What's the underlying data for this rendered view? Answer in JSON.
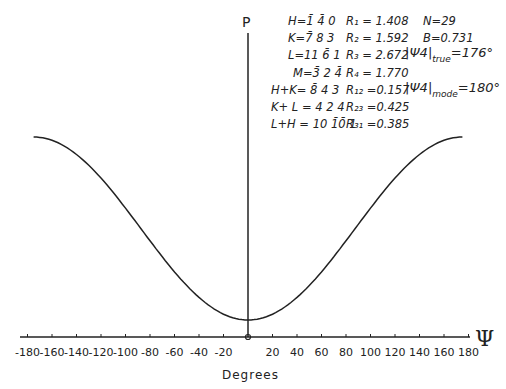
{
  "chart_data": {
    "type": "line",
    "title": "",
    "xlabel": "Degrees",
    "ylabel": "P",
    "x_axis_symbol": "Ψ",
    "xlim": [
      -180,
      180
    ],
    "x_ticks": [
      -180,
      -160,
      -140,
      -120,
      -100,
      -80,
      -60,
      -40,
      -20,
      20,
      40,
      60,
      80,
      100,
      120,
      140,
      160,
      180
    ],
    "x_tick_labels": [
      "-180",
      "-160",
      "-140",
      "-120",
      "-100",
      "-80",
      "-60",
      "-40",
      "-20",
      "20",
      "40",
      "60",
      "80",
      "100",
      "120",
      "140",
      "160",
      "180"
    ],
    "grid": false,
    "series": [
      {
        "name": "P(Ψ)",
        "x": [
          -175,
          -160,
          -140,
          -120,
          -100,
          -80,
          -60,
          -40,
          -20,
          0,
          20,
          40,
          60,
          80,
          100,
          120,
          140,
          160,
          175
        ],
        "y_relative": [
          1.0,
          0.95,
          0.82,
          0.64,
          0.45,
          0.28,
          0.14,
          0.06,
          0.015,
          0.0,
          0.015,
          0.06,
          0.14,
          0.28,
          0.45,
          0.64,
          0.82,
          0.95,
          1.0
        ]
      }
    ],
    "annotations": [
      {
        "label": "H",
        "value": "= 1̄ 4̄ 0",
        "R_label": "R1",
        "R_value": "1.408",
        "extra": "N=29"
      },
      {
        "label": "K",
        "value": "= 7̄ 8 3",
        "R_label": "R2",
        "R_value": "1.592",
        "extra": "B=0.731"
      },
      {
        "label": "L",
        "value": "= 11 6̄ 1",
        "R_label": "R3",
        "R_value": "2.672",
        "extra": "|Ψ4|true =176°"
      },
      {
        "label": "M",
        "value": "= 3̄ 2 4̄",
        "R_label": "R4",
        "R_value": "1.770",
        "extra": ""
      },
      {
        "label": "H+K",
        "value": "= 8̄ 4 3",
        "R_label": "R12",
        "R_value": "0.157",
        "extra": "|Ψ4|mode =180°"
      },
      {
        "label": "K+L",
        "value": "= 4 2 4",
        "R_label": "R23",
        "R_value": "0.425",
        "extra": ""
      },
      {
        "label": "L+H",
        "value": "= 10 1̄0̄ 1",
        "R_label": "R31",
        "R_value": "0.385",
        "extra": ""
      }
    ]
  },
  "labels": {
    "p_axis": "P",
    "psi_axis": "Ψ",
    "degrees": "Degrees"
  },
  "annotation_text": {
    "row1_left": "H=1̄ 4̄ 0",
    "row1_r": "R₁ = 1.408",
    "row1_extra": "N=29",
    "row2_left": "K=7̄ 8 3",
    "row2_r": "R₂ = 1.592",
    "row2_extra": "B=0.731",
    "row3_left": "L=11 6̄ 1",
    "row3_r": "R₃ = 2.672",
    "row4_left": "M=3̄ 2 4̄",
    "row4_r": "R₄ = 1.770",
    "row5_left": "H+K= 8̄ 4 3",
    "row5_r": "R₁₂ =0.157",
    "row6_left": "K+ L = 4 2 4",
    "row6_r": "R₂₃ =0.425",
    "row7_left": "L+H = 10 1̄0̄ 1",
    "row7_r": "R₃₁ =0.385",
    "psi_true_sym": "|Ψ4|",
    "psi_true_sub": "true",
    "psi_true_val": "=176°",
    "psi_mode_sym": "|Ψ4|",
    "psi_mode_sub": "mode",
    "psi_mode_val": "=180°"
  }
}
